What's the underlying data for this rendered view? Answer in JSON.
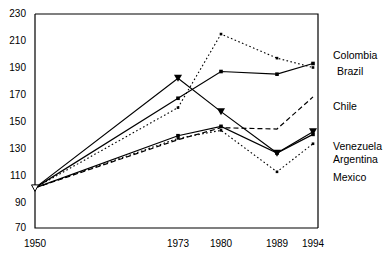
{
  "chart_data": {
    "type": "line",
    "title": "",
    "xlabel": "",
    "ylabel": "",
    "x": [
      1950,
      1973,
      1980,
      1989,
      1994
    ],
    "xtick_labels": [
      "1950",
      "1973",
      "1980",
      "1989",
      "1994"
    ],
    "ytick_labels": [
      "230",
      "210",
      "190",
      "170",
      "150",
      "130",
      "110",
      "90",
      "70"
    ],
    "ylim": [
      70,
      230
    ],
    "ytick_step": 20,
    "grid": false,
    "legend_position": "right",
    "series": [
      {
        "name": "Colombia",
        "style": "dotted",
        "marker": "square",
        "values": [
          100,
          160,
          215,
          197,
          190
        ]
      },
      {
        "name": "Brazil",
        "style": "solid",
        "marker": "square",
        "values": [
          100,
          167,
          187,
          185,
          193
        ]
      },
      {
        "name": "Chile",
        "style": "dashed",
        "marker": "none",
        "values": [
          100,
          136,
          145,
          144,
          168
        ]
      },
      {
        "name": "Venezuela",
        "style": "solid",
        "marker": "triangle-down",
        "values": [
          100,
          182,
          157,
          126,
          142
        ]
      },
      {
        "name": "Argentina",
        "style": "solid",
        "marker": "square",
        "values": [
          100,
          139,
          146,
          126,
          140
        ]
      },
      {
        "name": "Mexico",
        "style": "dotted",
        "marker": "square",
        "values": [
          100,
          137,
          143,
          112,
          133
        ]
      }
    ]
  },
  "axis": {
    "yticks": [
      {
        "label": "230"
      },
      {
        "label": "210"
      },
      {
        "label": "190"
      },
      {
        "label": "170"
      },
      {
        "label": "150"
      },
      {
        "label": "130"
      },
      {
        "label": "110"
      },
      {
        "label": "90"
      },
      {
        "label": "70"
      }
    ],
    "xticks": [
      {
        "label": "1950"
      },
      {
        "label": "1973"
      },
      {
        "label": "1980"
      },
      {
        "label": "1989"
      },
      {
        "label": "1994"
      }
    ]
  },
  "legend": {
    "items": [
      {
        "label": "Colombia"
      },
      {
        "label": "Brazil"
      },
      {
        "label": "Chile"
      },
      {
        "label": "Venezuela"
      },
      {
        "label": "Argentina"
      },
      {
        "label": "Mexico"
      }
    ]
  },
  "colors": {
    "line": "#000000",
    "axis": "#000000",
    "background": "#ffffff",
    "text": "#000000"
  }
}
